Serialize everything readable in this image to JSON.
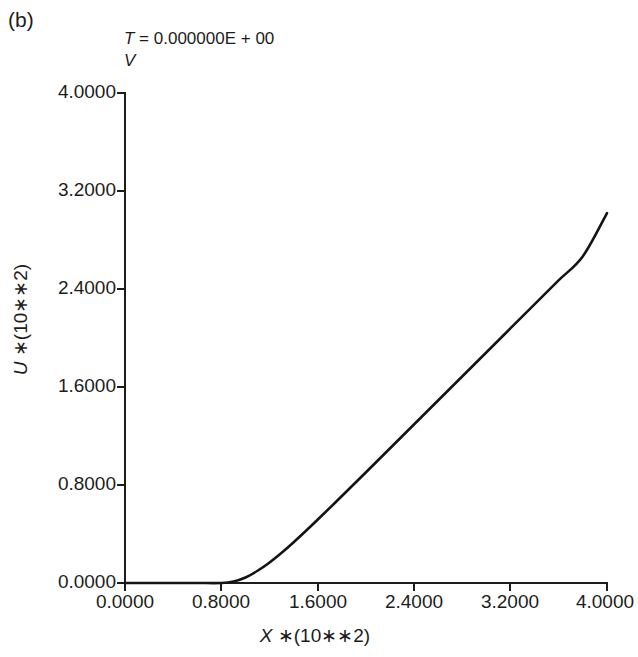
{
  "figure": {
    "panel_label": "(b)",
    "background_color": "#ffffff",
    "line_color": "#141414",
    "axis_color": "#1d1d1b"
  },
  "title": {
    "line_1_var": "T",
    "line_1_rest": " = 0.000000E + 00",
    "line_2": "V"
  },
  "axes": {
    "x_title_var": "X",
    "x_title_rest": " ∗(10∗∗2)",
    "y_title_var": "U",
    "y_title_rest": " ∗(10∗∗2)"
  },
  "chart_data": {
    "type": "line",
    "title": "T = 0.000000E + 00 V",
    "xlabel": "X *(10**2)",
    "ylabel": "U *(10**2)",
    "xlim": [
      0.0,
      4.0
    ],
    "ylim": [
      0.0,
      4.0
    ],
    "grid": false,
    "legend": "none",
    "xticks": [
      0.0,
      0.8,
      1.6,
      2.4,
      3.2,
      4.0
    ],
    "yticks": [
      0.0,
      0.8,
      1.6,
      2.4,
      3.2,
      4.0
    ],
    "xtick_labels": [
      "0.0000",
      "0.8000",
      "1.6000",
      "2.4000",
      "3.2000",
      "4.0000"
    ],
    "ytick_labels": [
      "0.0000",
      "0.8000",
      "1.6000",
      "2.4000",
      "3.2000",
      "4.0000"
    ],
    "series": [
      {
        "name": "U(X)",
        "x": [
          0.0,
          0.2,
          0.4,
          0.6,
          0.8,
          0.9,
          1.0,
          1.1,
          1.2,
          1.3,
          1.4,
          1.5,
          1.6,
          1.8,
          2.0,
          2.2,
          2.4,
          2.6,
          2.8,
          3.0,
          3.2,
          3.4,
          3.6,
          3.8,
          4.0
        ],
        "y": [
          0.0,
          0.0,
          0.0,
          0.0,
          0.0,
          0.012,
          0.045,
          0.1,
          0.168,
          0.247,
          0.333,
          0.424,
          0.518,
          0.71,
          0.904,
          1.1,
          1.296,
          1.492,
          1.688,
          1.884,
          2.08,
          2.276,
          2.472,
          2.668,
          3.02
        ]
      }
    ],
    "annotations": []
  }
}
